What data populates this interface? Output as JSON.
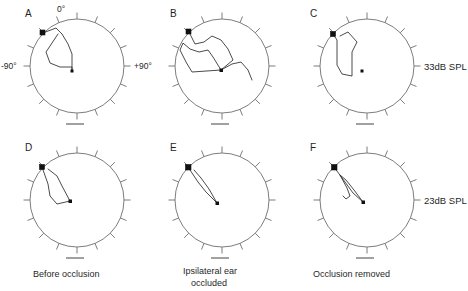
{
  "figure": {
    "width": 468,
    "height": 291,
    "background": "#ffffff",
    "line_color": "#2a2a2a",
    "circle_color": "#6e6e6e",
    "scalebar_color": "#8a8a8a"
  },
  "axis": {
    "top_label": "0°",
    "left_label": "-90°",
    "right_label": "+90°",
    "tick_count": 16,
    "shown_on_panel": "A"
  },
  "row_labels": [
    {
      "id": "row-1-spl",
      "text": "33dB SPL"
    },
    {
      "id": "row-2-spl",
      "text": "23dB SPL"
    }
  ],
  "column_captions": [
    {
      "id": "caption-col-1",
      "lines": [
        "Before occlusion"
      ]
    },
    {
      "id": "caption-col-2",
      "lines": [
        "Ipsilateral ear",
        "occluded"
      ]
    },
    {
      "id": "caption-col-3",
      "lines": [
        "Occlusion removed"
      ]
    }
  ],
  "panels": [
    {
      "letter": "A",
      "cx": 77,
      "cy": 66,
      "r": 47,
      "spl": "33dB SPL",
      "condition": "Before occlusion",
      "start": {
        "x": 43,
        "y": 33
      },
      "end": {
        "x": 72,
        "y": 71
      },
      "path": "M 43 33 L 56 28 L 62 34 L 68 44 L 72 54 L 72 71 L 72 67 L 60 67 L 50 63 L 46 52 L 52 43 L 58 34"
    },
    {
      "letter": "B",
      "cx": 222,
      "cy": 66,
      "r": 47,
      "spl": "33dB SPL",
      "condition": "Ipsilateral ear occluded",
      "start": {
        "x": 189,
        "y": 32
      },
      "end": {
        "x": 221,
        "y": 70
      },
      "path": "M 189 32 L 195 44 L 204 42 L 212 36 L 221 40 L 228 49 L 233 60 L 221 70 L 213 57 L 208 50 L 199 52 L 190 49 L 183 43 L 180 50 L 186 62 L 192 72 L 221 70 L 232 64 L 241 62 L 248 70 L 252 80"
    },
    {
      "letter": "C",
      "cx": 367,
      "cy": 66,
      "r": 47,
      "spl": "33dB SPL",
      "condition": "Occlusion removed",
      "start": {
        "x": 333,
        "y": 34
      },
      "end": {
        "x": 362,
        "y": 71
      },
      "path": "M 333 34 L 337 40 L 337 53 L 337 65 L 342 74 L 352 76 L 352 70 L 352 52 L 357 42 L 348 32 L 340 36"
    },
    {
      "letter": "D",
      "cx": 77,
      "cy": 200,
      "r": 47,
      "spl": "23dB SPL",
      "condition": "Before occlusion",
      "start": {
        "x": 42,
        "y": 167
      },
      "end": {
        "x": 70,
        "y": 201
      },
      "path": "M 42 167 L 48 184 L 50 196 L 57 204 L 70 201 L 62 186 L 57 176 L 48 169"
    },
    {
      "letter": "E",
      "cx": 222,
      "cy": 200,
      "r": 47,
      "spl": "23dB SPL",
      "condition": "Ipsilateral ear occluded",
      "start": {
        "x": 188,
        "y": 167
      },
      "end": {
        "x": 217,
        "y": 203
      },
      "path": "M 188 167 L 198 182 L 206 192 L 217 203 L 209 189 L 201 178 L 194 170"
    },
    {
      "letter": "F",
      "cx": 367,
      "cy": 200,
      "r": 47,
      "spl": "23dB SPL",
      "condition": "Occlusion removed",
      "start": {
        "x": 334,
        "y": 167
      },
      "end": {
        "x": 363,
        "y": 202
      },
      "path": "M 334 167 L 345 182 L 353 193 L 363 202 L 354 190 L 346 180 L 340 175 L 347 188 L 350 196 L 346 199 L 343 196"
    }
  ]
}
